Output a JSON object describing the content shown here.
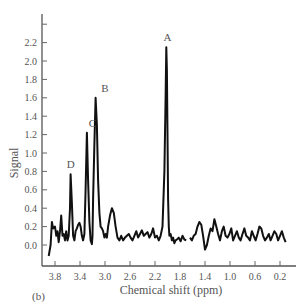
{
  "panel_label": "(b)",
  "chart_data": {
    "type": "line",
    "title": "",
    "xlabel": "Chemical shift (ppm)",
    "ylabel": "Signal",
    "x_reversed": true,
    "xlim": [
      3.9,
      0.1
    ],
    "ylim": [
      -0.15,
      2.5
    ],
    "x_ticks": [
      3.8,
      3.4,
      3.0,
      2.6,
      2.2,
      1.8,
      1.4,
      1.0,
      0.6,
      0.2
    ],
    "x_tick_labels": [
      "3.8",
      "3.4",
      "3.0",
      "2.6",
      "2.2",
      "1.8",
      "1.4",
      "1.0",
      "0.6",
      "0.2"
    ],
    "y_ticks": [
      0.0,
      0.2,
      0.4,
      0.6,
      0.8,
      1.0,
      1.2,
      1.4,
      1.6,
      1.8,
      2.0,
      2.2,
      2.4
    ],
    "y_tick_labels": [
      "0.0",
      "0.2",
      "0.4",
      "0.6",
      "0.8",
      "1.0",
      "1.2",
      "1.4",
      "1.6",
      "1.8",
      "2.0",
      "2.2",
      ""
    ],
    "grid": false,
    "legend": null,
    "peaks": [
      {
        "label": "A",
        "ppm": 2.0,
        "signal": 2.15
      },
      {
        "label": "B",
        "ppm": 3.0,
        "signal": 1.6
      },
      {
        "label": "C",
        "ppm": 3.2,
        "signal": 1.22
      },
      {
        "label": "D",
        "ppm": 3.55,
        "signal": 0.77
      }
    ],
    "series": [
      {
        "name": "spectrum",
        "x": [
          3.9,
          3.87,
          3.85,
          3.83,
          3.8,
          3.78,
          3.76,
          3.74,
          3.72,
          3.7,
          3.68,
          3.66,
          3.64,
          3.62,
          3.6,
          3.58,
          3.56,
          3.55,
          3.53,
          3.51,
          3.49,
          3.47,
          3.45,
          3.43,
          3.41,
          3.39,
          3.37,
          3.35,
          3.33,
          3.31,
          3.29,
          3.27,
          3.25,
          3.23,
          3.21,
          3.2,
          3.19,
          3.17,
          3.15,
          3.13,
          3.11,
          3.09,
          3.07,
          3.05,
          3.03,
          3.01,
          3.0,
          2.99,
          2.97,
          2.95,
          2.92,
          2.89,
          2.86,
          2.83,
          2.8,
          2.77,
          2.74,
          2.71,
          2.68,
          2.65,
          2.62,
          2.59,
          2.56,
          2.53,
          2.5,
          2.47,
          2.44,
          2.41,
          2.38,
          2.35,
          2.32,
          2.29,
          2.26,
          2.23,
          2.2,
          2.17,
          2.14,
          2.11,
          2.08,
          2.05,
          2.03,
          2.02,
          2.01,
          2.0,
          1.99,
          1.98,
          1.97,
          1.95,
          1.93,
          1.91,
          1.89,
          1.87,
          1.85,
          1.82,
          1.79,
          1.76,
          1.73,
          1.7,
          1.67,
          1.64,
          1.61,
          1.58,
          1.55,
          1.52,
          1.49,
          1.46,
          1.43,
          1.4,
          1.37,
          1.34,
          1.31,
          1.28,
          1.25,
          1.22,
          1.19,
          1.16,
          1.13,
          1.1,
          1.07,
          1.04,
          1.01,
          0.98,
          0.95,
          0.92,
          0.89,
          0.86,
          0.83,
          0.8,
          0.77,
          0.74,
          0.71,
          0.68,
          0.65,
          0.62,
          0.59,
          0.56,
          0.53,
          0.5,
          0.47,
          0.44,
          0.41,
          0.38,
          0.35,
          0.32,
          0.29,
          0.26,
          0.23,
          0.2,
          0.17,
          0.14,
          0.11
        ],
        "y": [
          -0.12,
          0.0,
          0.25,
          0.18,
          0.2,
          0.1,
          0.15,
          0.03,
          0.15,
          0.32,
          0.1,
          0.12,
          0.05,
          0.15,
          0.05,
          0.1,
          0.4,
          0.77,
          0.45,
          0.1,
          0.05,
          0.15,
          0.18,
          0.22,
          0.24,
          0.2,
          0.1,
          0.05,
          0.12,
          0.6,
          1.22,
          0.7,
          0.25,
          0.05,
          0.01,
          0.1,
          0.5,
          1.1,
          1.6,
          1.3,
          0.7,
          0.35,
          0.2,
          0.18,
          0.15,
          0.08,
          0.1,
          0.12,
          0.08,
          0.2,
          0.32,
          0.4,
          0.35,
          0.2,
          0.08,
          0.05,
          0.1,
          0.05,
          0.08,
          0.1,
          0.12,
          0.08,
          0.05,
          0.1,
          0.15,
          0.08,
          0.12,
          0.16,
          0.1,
          0.12,
          0.14,
          0.08,
          0.12,
          0.18,
          0.08,
          0.1,
          0.05,
          0.1,
          0.2,
          0.8,
          1.6,
          2.15,
          1.9,
          1.2,
          0.5,
          0.2,
          0.1,
          0.12,
          0.05,
          0.08,
          0.02,
          0.05,
          0.06,
          0.08,
          0.04,
          0.1,
          0.06,
          0.05,
          null,
          0.08,
          0.05,
          0.1,
          0.12,
          0.2,
          0.25,
          0.22,
          0.1,
          -0.05,
          0.0,
          0.1,
          0.18,
          0.15,
          0.28,
          0.2,
          0.12,
          0.05,
          0.15,
          0.2,
          0.1,
          0.08,
          0.12,
          0.18,
          0.05,
          0.1,
          0.15,
          0.08,
          0.05,
          0.12,
          0.18,
          0.1,
          0.08,
          0.05,
          0.15,
          0.1,
          0.05,
          0.12,
          0.2,
          0.18,
          0.1,
          0.05,
          0.08,
          0.12,
          0.05,
          0.1,
          0.15,
          0.12,
          0.05,
          0.1,
          0.15,
          0.08,
          0.03
        ]
      }
    ]
  }
}
